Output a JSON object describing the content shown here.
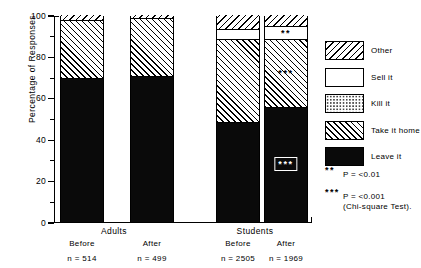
{
  "chart_data": {
    "type": "bar",
    "title": "",
    "xlabel": "",
    "ylabel": "Percentage of Responses",
    "ylim": [
      0,
      100
    ],
    "grid": false,
    "stacked": true,
    "legend_position": "right",
    "categories": [
      "Before",
      "After",
      "Before",
      "After"
    ],
    "groups": [
      {
        "name": "Adults",
        "members": [
          "Before",
          "After"
        ]
      },
      {
        "name": "Students",
        "members": [
          "Before",
          "After"
        ]
      }
    ],
    "sample_sizes": [
      "n = 514",
      "n = 499",
      "n = 2505",
      "n = 1969"
    ],
    "series": [
      {
        "name": "Leave it",
        "values": [
          69,
          70,
          48,
          55
        ]
      },
      {
        "name": "Take it home",
        "values": [
          28,
          28,
          40,
          33
        ]
      },
      {
        "name": "Kill it",
        "values": [
          0,
          0,
          0,
          0
        ]
      },
      {
        "name": "Sell it",
        "values": [
          0,
          0,
          5,
          6
        ]
      },
      {
        "name": "Other",
        "values": [
          3,
          2,
          7,
          6
        ]
      }
    ],
    "yticks_major": [
      0,
      20,
      40,
      60,
      80,
      100
    ],
    "yticks_minor": [
      10,
      30,
      50,
      70,
      90
    ],
    "annotations": [
      {
        "label": "***",
        "bar": "Students After",
        "segment": "Leave it"
      },
      {
        "label": "***",
        "bar": "Students After",
        "segment": "Take it home"
      },
      {
        "label": "**",
        "bar": "Students After",
        "segment": "Sell it"
      }
    ]
  },
  "axis": {
    "y_title": "Percentage of Responses",
    "ticks": [
      "100",
      "80",
      "60",
      "40",
      "20",
      "0"
    ]
  },
  "groups": {
    "adults": {
      "label": "Adults"
    },
    "students": {
      "label": "Students"
    }
  },
  "bars": [
    {
      "sub": "Before",
      "n": "n = 514"
    },
    {
      "sub": "After",
      "n": "n = 499"
    },
    {
      "sub": "Before",
      "n": "n = 2505"
    },
    {
      "sub": "After",
      "n": "n = 1969"
    }
  ],
  "legend": {
    "items": [
      {
        "label": "Other",
        "pattern": "back-hatch"
      },
      {
        "label": "Sell it",
        "pattern": "solid-white"
      },
      {
        "label": "Kill it",
        "pattern": "dots"
      },
      {
        "label": "Take it home",
        "pattern": "forward-hatch"
      },
      {
        "label": "Leave it",
        "pattern": "solid-black"
      }
    ]
  },
  "significance": {
    "two_star": {
      "marks": "**",
      "text": "P = <0.01"
    },
    "three_star": {
      "marks": "***",
      "text": "P = <0.001",
      "text2": "(Chi-square Test)."
    }
  },
  "stars": {
    "two": "**",
    "three": "***"
  }
}
